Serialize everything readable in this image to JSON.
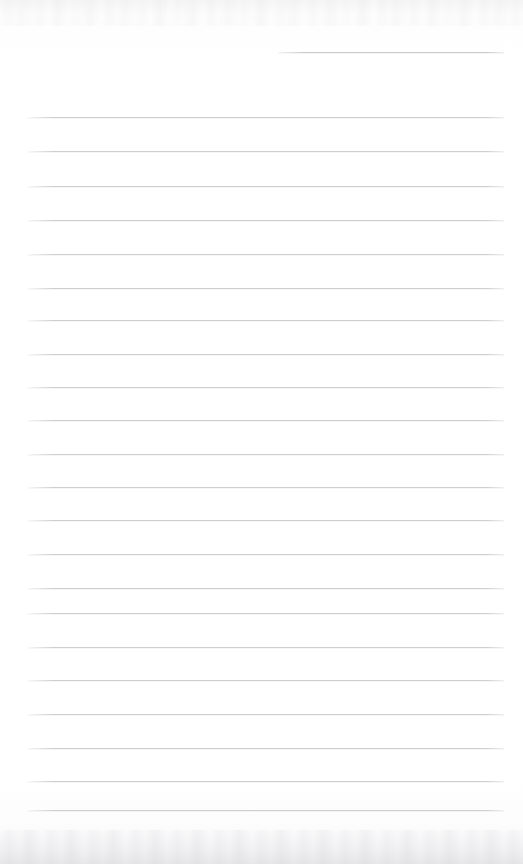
{
  "document": {
    "kind": "scanned-lined-paper",
    "title": "Blank ruled notebook page",
    "written_text": "",
    "page_width": 523,
    "page_height": 864,
    "paper_color": "#fdfdfd",
    "rule_color": "#c9cacd",
    "rule_count_full": 21,
    "rule_count_partial": 1,
    "rule_spacing_px": 34.6,
    "margin_left_px": 28,
    "margin_right_px": 504,
    "has_left_margin_rule": false,
    "has_header_text": false,
    "has_page_number": false
  },
  "rules": [
    {
      "name": "partial-top-rule",
      "y": 52,
      "x1": 278,
      "x2": 504,
      "partial": true
    },
    {
      "name": "rule-1",
      "y": 117,
      "x1": 28,
      "x2": 504,
      "partial": false
    },
    {
      "name": "rule-2",
      "y": 151,
      "x1": 28,
      "x2": 504,
      "partial": false
    },
    {
      "name": "rule-3",
      "y": 186,
      "x1": 28,
      "x2": 504,
      "partial": false
    },
    {
      "name": "rule-4",
      "y": 220,
      "x1": 28,
      "x2": 504,
      "partial": false
    },
    {
      "name": "rule-5",
      "y": 254,
      "x1": 28,
      "x2": 504,
      "partial": false
    },
    {
      "name": "rule-6",
      "y": 288,
      "x1": 28,
      "x2": 504,
      "partial": false
    },
    {
      "name": "rule-7",
      "y": 320,
      "x1": 28,
      "x2": 504,
      "partial": false
    },
    {
      "name": "rule-8",
      "y": 354,
      "x1": 28,
      "x2": 504,
      "partial": false
    },
    {
      "name": "rule-9",
      "y": 387,
      "x1": 28,
      "x2": 504,
      "partial": false
    },
    {
      "name": "rule-10",
      "y": 420,
      "x1": 28,
      "x2": 504,
      "partial": false
    },
    {
      "name": "rule-11",
      "y": 454,
      "x1": 28,
      "x2": 504,
      "partial": false
    },
    {
      "name": "rule-12",
      "y": 487,
      "x1": 28,
      "x2": 504,
      "partial": false
    },
    {
      "name": "rule-13",
      "y": 520,
      "x1": 28,
      "x2": 504,
      "partial": false
    },
    {
      "name": "rule-14",
      "y": 554,
      "x1": 28,
      "x2": 504,
      "partial": false
    },
    {
      "name": "rule-15",
      "y": 588,
      "x1": 28,
      "x2": 504,
      "partial": false
    },
    {
      "name": "rule-16",
      "y": 613,
      "x1": 28,
      "x2": 504,
      "partial": false
    },
    {
      "name": "rule-17",
      "y": 647,
      "x1": 28,
      "x2": 504,
      "partial": false
    },
    {
      "name": "rule-18",
      "y": 680,
      "x1": 28,
      "x2": 504,
      "partial": false
    },
    {
      "name": "rule-19",
      "y": 714,
      "x1": 28,
      "x2": 504,
      "partial": false
    },
    {
      "name": "rule-20",
      "y": 748,
      "x1": 28,
      "x2": 504,
      "partial": false
    },
    {
      "name": "rule-21",
      "y": 781,
      "x1": 28,
      "x2": 504,
      "partial": false
    },
    {
      "name": "rule-22",
      "y": 810,
      "x1": 28,
      "x2": 504,
      "partial": false
    }
  ]
}
